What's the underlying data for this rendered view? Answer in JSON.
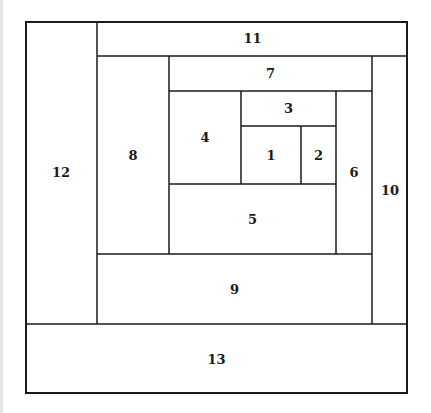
{
  "diagram": {
    "type": "nested-rectangle-partition",
    "line_color": "#1a1a1a",
    "background": "#ffffff",
    "outer_frame": {
      "x": 25,
      "y": 21,
      "width": 383,
      "height": 373
    },
    "regions": [
      {
        "id": "1",
        "label": "1",
        "x": 241,
        "y": 126,
        "width": 60,
        "height": 58
      },
      {
        "id": "2",
        "label": "2",
        "x": 301,
        "y": 126,
        "width": 35,
        "height": 58
      },
      {
        "id": "3",
        "label": "3",
        "x": 241,
        "y": 91,
        "width": 95,
        "height": 35
      },
      {
        "id": "4",
        "label": "4",
        "x": 169,
        "y": 91,
        "width": 72,
        "height": 93
      },
      {
        "id": "5",
        "label": "5",
        "x": 169,
        "y": 184,
        "width": 167,
        "height": 70
      },
      {
        "id": "6",
        "label": "6",
        "x": 336,
        "y": 91,
        "width": 36,
        "height": 163
      },
      {
        "id": "7",
        "label": "7",
        "x": 169,
        "y": 56,
        "width": 203,
        "height": 35
      },
      {
        "id": "8",
        "label": "8",
        "x": 97,
        "y": 56,
        "width": 72,
        "height": 198
      },
      {
        "id": "9",
        "label": "9",
        "x": 97,
        "y": 254,
        "width": 275,
        "height": 70
      },
      {
        "id": "10",
        "label": "10",
        "x": 372,
        "y": 56,
        "width": 36,
        "height": 268
      },
      {
        "id": "11",
        "label": "11",
        "x": 97,
        "y": 21,
        "width": 311,
        "height": 35
      },
      {
        "id": "12",
        "label": "12",
        "x": 25,
        "y": 21,
        "width": 72,
        "height": 303
      },
      {
        "id": "13",
        "label": "13",
        "x": 25,
        "y": 324,
        "width": 383,
        "height": 70
      }
    ]
  }
}
